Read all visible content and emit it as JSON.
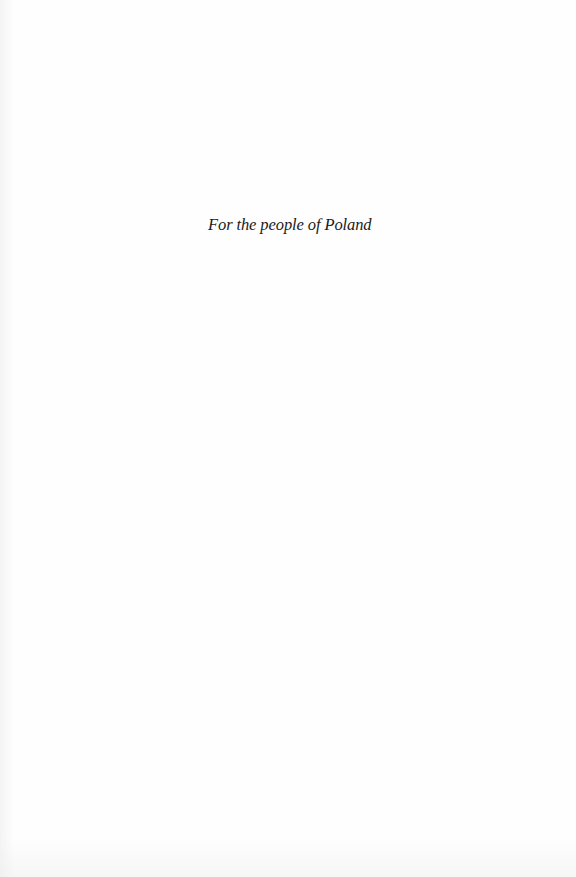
{
  "page": {
    "type": "dedication",
    "dedication_text": "For the people of Poland",
    "colors": {
      "background": "#fefefe",
      "text": "#1a1a1a"
    }
  }
}
